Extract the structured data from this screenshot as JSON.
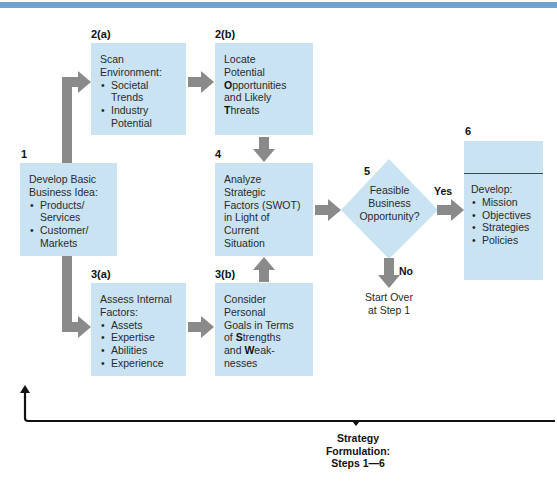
{
  "diagram": {
    "colors": {
      "box_fill": "#c9e3f2",
      "arrow_gray": "#8a8a8a",
      "top_stripe": "#6fa3d2",
      "feedback_line": "#111111"
    },
    "steps": {
      "s1": {
        "label": "1",
        "title_line1": "Develop Basic",
        "title_line2": "Business Idea:",
        "items": [
          "Products/ Services",
          "Customer/ Markets"
        ]
      },
      "s2a": {
        "label": "2(a)",
        "title_line1": "Scan",
        "title_line2": "Environment:",
        "items": [
          "Societal Trends",
          "Industry Potential"
        ]
      },
      "s2b": {
        "label": "2(b)",
        "line1": "Locate",
        "line2": "Potential",
        "line3_bold": "O",
        "line3_rest": "pportunities",
        "line4": "and Likely",
        "line5_bold": "T",
        "line5_rest": "hreats"
      },
      "s3a": {
        "label": "3(a)",
        "title_line1": "Assess Internal",
        "title_line2": "Factors:",
        "items": [
          "Assets",
          "Expertise",
          "Abilities",
          "Experience"
        ]
      },
      "s3b": {
        "label": "3(b)",
        "line1": "Consider",
        "line2": "Personal",
        "line3": "Goals in Terms",
        "line4_pre": "of ",
        "line4_bold": "S",
        "line4_rest": "trengths",
        "line5_pre": "and ",
        "line5_bold": "W",
        "line5_rest": "eak-",
        "line6": "nesses"
      },
      "s4": {
        "label": "4",
        "lines": [
          "Analyze",
          "Strategic",
          "Factors (SWOT)",
          "in Light of",
          "Current",
          "Situation"
        ]
      },
      "s5": {
        "label": "5",
        "lines": [
          "Feasible",
          "Business",
          "Opportunity?"
        ]
      },
      "s6": {
        "label": "6",
        "title": "Develop:",
        "items": [
          "Mission",
          "Objectives",
          "Strategies",
          "Policies"
        ]
      }
    },
    "edges": {
      "yes_label": "Yes",
      "no_label": "No",
      "start_over_line1": "Start Over",
      "start_over_line2": "at Step 1"
    },
    "footer": {
      "line1": "Strategy",
      "line2": "Formulation:",
      "line3": "Steps 1—6"
    }
  }
}
